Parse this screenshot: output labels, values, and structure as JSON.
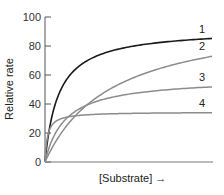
{
  "chart_data": {
    "type": "line",
    "title": "",
    "xlabel": "[Substrate] →",
    "ylabel": "Relative rate",
    "ylim": [
      0,
      100
    ],
    "yticks": [
      0,
      20,
      40,
      60,
      80,
      100
    ],
    "grid": false,
    "legend": "inline numeric labels at right end of each curve",
    "x": [
      0,
      0.5,
      1,
      2,
      3,
      4,
      5,
      6,
      7,
      8,
      9,
      10
    ],
    "series": [
      {
        "name": "1",
        "color": "#1a1a1a",
        "vmax": 92,
        "km": 0.8,
        "end_value": 85
      },
      {
        "name": "2",
        "color": "#8c8c8c",
        "vmax": 102,
        "km": 4.0,
        "end_value": 73
      },
      {
        "name": "3",
        "color": "#8c8c8c",
        "vmax": 58,
        "km": 1.2,
        "end_value": 52
      },
      {
        "name": "4",
        "color": "#8c8c8c",
        "vmax": 34.5,
        "km": 0.15,
        "end_value": 34
      }
    ]
  },
  "axis": {
    "y_title": "Relative rate",
    "x_title": "[Substrate] →",
    "y_ticks": [
      "0",
      "20",
      "40",
      "60",
      "80",
      "100"
    ]
  },
  "labels": [
    "1",
    "2",
    "3",
    "4"
  ]
}
